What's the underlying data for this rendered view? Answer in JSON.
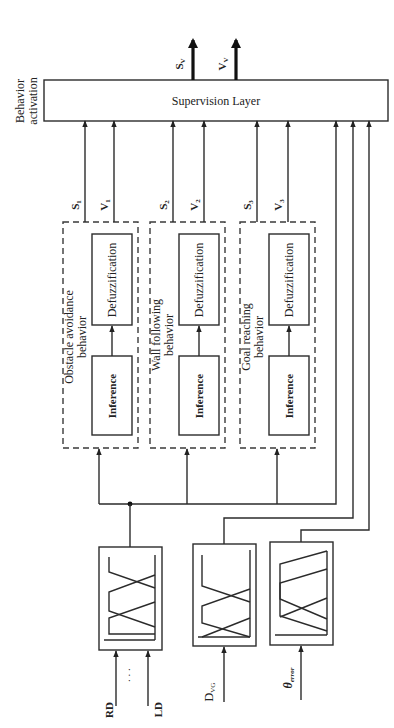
{
  "diagram": {
    "orientation": "rotated-90-ccw",
    "supervision": {
      "label": "Supervision Layer",
      "side_label_line1": "Behavior",
      "side_label_line2": "activation",
      "outputs": [
        {
          "label": "S",
          "sub": "V"
        },
        {
          "label": "V",
          "sub": "V"
        }
      ]
    },
    "behaviors": [
      {
        "name_line1": "Obstacle avoidance",
        "name_line2": "behavior",
        "inference": "Inference",
        "defuzz": "Defuzzification",
        "out_s": "S",
        "out_s_sub": "1",
        "out_v": "V",
        "out_v_sub": "1"
      },
      {
        "name_line1": "Wall following",
        "name_line2": "behavior",
        "inference": "Inference",
        "defuzz": "Defuzzification",
        "out_s": "S",
        "out_s_sub": "2",
        "out_v": "V",
        "out_v_sub": "2"
      },
      {
        "name_line1": "Goal reaching",
        "name_line2": "behavior",
        "inference": "Inference",
        "defuzz": "Defuzzification",
        "out_s": "S",
        "out_s_sub": "3",
        "out_v": "V",
        "out_v_sub": "3"
      }
    ],
    "inputs": [
      {
        "label": "RD",
        "label2": "LD",
        "ellipsis": ". . .",
        "kind": "distance-sensors"
      },
      {
        "label": "D",
        "sub": "VG",
        "kind": "goal-distance"
      },
      {
        "label": "θ",
        "sub": "error",
        "kind": "heading-error"
      }
    ]
  }
}
